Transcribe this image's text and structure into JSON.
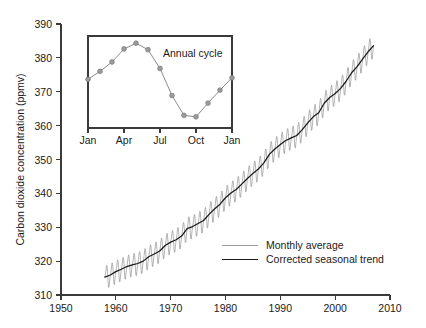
{
  "chart_data": {
    "type": "line",
    "title": "",
    "xlabel": "",
    "ylabel": "Carbon dioxide concentration (ppmv)",
    "xlim": [
      1950,
      2010
    ],
    "ylim": [
      310,
      390
    ],
    "xticks": [
      1950,
      1960,
      1970,
      1980,
      1990,
      2000,
      2010
    ],
    "xticklabels": [
      "1950",
      "1960",
      "1970",
      "1980",
      "1990",
      "2000",
      "2010"
    ],
    "yticks": [
      310,
      320,
      330,
      340,
      350,
      360,
      370,
      380,
      390
    ],
    "yticklabels": [
      "310",
      "320",
      "330",
      "340",
      "350",
      "360",
      "370",
      "380",
      "390"
    ],
    "grid": false,
    "legend_position": "center-right",
    "legend": [
      {
        "name": "Monthly average",
        "color": "#9a9a9a"
      },
      {
        "name": "Corrected seasonal trend",
        "color": "#1a1a1a"
      }
    ],
    "series": [
      {
        "name": "Corrected seasonal trend",
        "color": "#1a1a1a",
        "x": [
          1958.0,
          1959.0,
          1960.0,
          1961.0,
          1962.0,
          1963.0,
          1964.0,
          1965.0,
          1966.0,
          1967.0,
          1968.0,
          1969.0,
          1970.0,
          1971.0,
          1972.0,
          1973.0,
          1974.0,
          1975.0,
          1976.0,
          1977.0,
          1978.0,
          1979.0,
          1980.0,
          1981.0,
          1982.0,
          1983.0,
          1984.0,
          1985.0,
          1986.0,
          1987.0,
          1988.0,
          1989.0,
          1990.0,
          1991.0,
          1992.0,
          1993.0,
          1994.0,
          1995.0,
          1996.0,
          1997.0,
          1998.0,
          1999.0,
          2000.0,
          2001.0,
          2002.0,
          2003.0,
          2004.0,
          2005.0,
          2006.0,
          2007.0
        ],
        "y": [
          315.3,
          315.9,
          316.9,
          317.6,
          318.4,
          318.9,
          319.3,
          320.0,
          321.3,
          322.1,
          323.0,
          324.6,
          325.6,
          326.3,
          327.4,
          329.6,
          330.2,
          331.1,
          332.0,
          333.8,
          335.4,
          336.8,
          338.7,
          340.1,
          341.2,
          342.8,
          344.4,
          345.9,
          347.2,
          349.0,
          351.5,
          353.1,
          354.4,
          355.6,
          356.4,
          357.1,
          358.8,
          360.8,
          362.6,
          363.8,
          366.6,
          368.3,
          369.5,
          371.0,
          373.1,
          375.6,
          377.4,
          379.6,
          381.8,
          383.6
        ]
      },
      {
        "name": "Monthly average",
        "color": "#9a9a9a",
        "description": "Monthly mean CO2 with seasonal oscillation of roughly +/- 3.5 ppmv superimposed on the trend; peak in May, minimum in late September/October.",
        "seasonal_amplitude_ppmv": 3.4,
        "seasonal_peak_month": "May",
        "seasonal_min_month": "Oct"
      }
    ],
    "inset": {
      "type": "line",
      "title": "Annual cycle",
      "xlabel": "",
      "ylabel": "",
      "xticklabels": [
        "Jan",
        "Apr",
        "Jul",
        "Oct",
        "Jan"
      ],
      "xticks_months": [
        1,
        4,
        7,
        10,
        13
      ],
      "categories": [
        "Jan",
        "Feb",
        "Mar",
        "Apr",
        "May",
        "Jun",
        "Jul",
        "Aug",
        "Sep",
        "Oct",
        "Nov",
        "Dec",
        "Jan"
      ],
      "values": [
        371.0,
        373.2,
        375.8,
        379.4,
        381.0,
        379.2,
        374.0,
        366.5,
        361.0,
        360.6,
        364.4,
        368.0,
        371.4
      ],
      "ylim_shared_with_main": true,
      "marker": "circle",
      "color": "#8c8c8c"
    }
  },
  "axis": {
    "ylabel": "Carbon dioxide concentration (ppmv)"
  },
  "legend": {
    "monthly_label": "Monthly average",
    "trend_label": "Corrected seasonal trend"
  },
  "inset": {
    "title": "Annual cycle",
    "tick_jan_left": "Jan",
    "tick_apr": "Apr",
    "tick_jul": "Jul",
    "tick_oct": "Oct",
    "tick_jan_right": "Jan"
  },
  "colors": {
    "monthly": "#9a9a9a",
    "trend": "#1a1a1a",
    "axis": "#3a3a3a",
    "background": "#ffffff"
  }
}
